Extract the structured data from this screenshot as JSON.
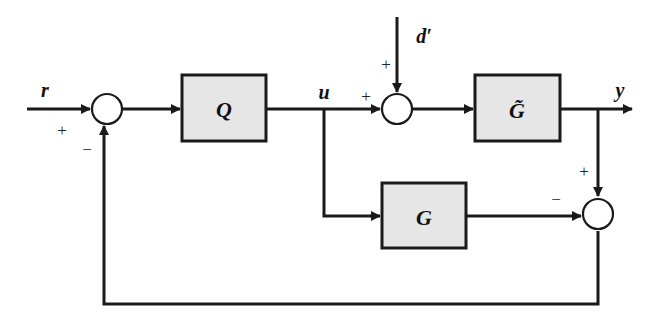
{
  "diagram": {
    "type": "block-diagram",
    "signals": {
      "reference": "r",
      "control": "u",
      "disturbance": "d′",
      "output": "y"
    },
    "blocks": {
      "controller": "Q",
      "plant": "G̃",
      "model": "G"
    },
    "sum_signs": {
      "sum1_ref": "+",
      "sum1_feedback": "−",
      "sum2_u": "+",
      "sum2_d": "+",
      "sum3_plant": "+",
      "sum3_model": "−"
    },
    "colors": {
      "block_fill": "#e6e6e6",
      "line": "#1a1a1a"
    }
  }
}
